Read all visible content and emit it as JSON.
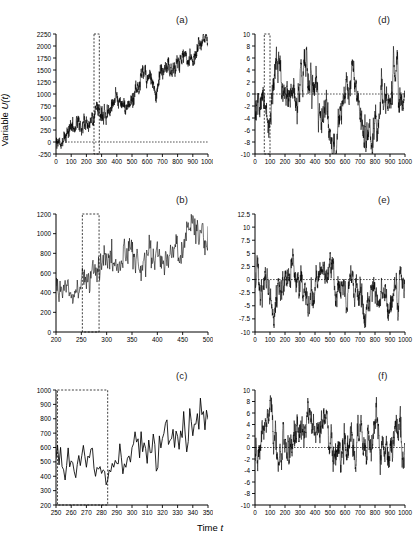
{
  "figure": {
    "axis_title_y_prefix": "Variable ",
    "axis_title_y_var": "U",
    "axis_title_y_arg": "(t)",
    "axis_title_x_prefix": "Time ",
    "axis_title_x_var": "t",
    "line_color": "#000000",
    "dash_color": "#2b2b2b",
    "background": "#ffffff"
  },
  "chart_data": [
    {
      "id": "a",
      "label": "(a)",
      "type": "line",
      "title": "",
      "xlabel": "",
      "ylabel": "",
      "xlim": [
        0,
        1000
      ],
      "ylim": [
        -250,
        2250
      ],
      "xticks": [
        0,
        100,
        200,
        300,
        400,
        500,
        600,
        700,
        800,
        900,
        1000
      ],
      "yticks": [
        -250,
        0,
        250,
        500,
        750,
        1000,
        1250,
        1500,
        1750,
        2000,
        2250
      ],
      "grid": false,
      "legend": null,
      "annotations": {
        "zero_line_y": 0,
        "highlight_box": {
          "x0": 250,
          "x1": 285,
          "y0": -250,
          "y1": 2250
        }
      },
      "series": [
        {
          "name": "U(t)",
          "description": "Random walk with positive linear drift, strongly trending from ~0 to ~2050 with dense high-frequency noise.",
          "model": "trend_noise",
          "n": 1000,
          "x_start": 0,
          "x_step": 1,
          "trend_start": 20,
          "trend_end": 2000,
          "noise_amplitude": 150,
          "noise_detail": 55,
          "seed": 17
        }
      ]
    },
    {
      "id": "b",
      "label": "(b)",
      "type": "line",
      "title": "",
      "xlabel": "",
      "ylabel": "",
      "xlim": [
        200,
        500
      ],
      "ylim": [
        0,
        1200
      ],
      "xticks": [
        200,
        250,
        300,
        350,
        400,
        450,
        500
      ],
      "yticks": [
        0,
        200,
        400,
        600,
        800,
        1000,
        1200
      ],
      "grid": false,
      "legend": null,
      "annotations": {
        "zero_line_y": null,
        "highlight_box": {
          "x0": 252,
          "x1": 285,
          "y0": 0,
          "y1": 1200
        }
      },
      "series": [
        {
          "name": "U(t)",
          "description": "Zoom of panel (a) over t = 200 to 500; mean rises from ~480 to ~980 with noise of about +/-150.",
          "model": "trend_noise",
          "n": 301,
          "x_start": 200,
          "x_step": 1,
          "trend_start": 470,
          "trend_end": 960,
          "noise_amplitude": 150,
          "noise_detail": 60,
          "seed": 17
        }
      ]
    },
    {
      "id": "c",
      "label": "(c)",
      "type": "line",
      "title": "",
      "xlabel": "",
      "ylabel": "",
      "xlim": [
        250,
        350
      ],
      "ylim": [
        200,
        1000
      ],
      "xticks": [
        250,
        260,
        270,
        280,
        290,
        300,
        310,
        320,
        330,
        340,
        350
      ],
      "yticks": [
        200,
        300,
        400,
        500,
        600,
        700,
        800,
        900,
        1000
      ],
      "grid": false,
      "legend": null,
      "annotations": {
        "zero_line_y": null,
        "highlight_box": {
          "x0": 251,
          "x1": 284,
          "y0": 200,
          "y1": 1000
        }
      },
      "series": [
        {
          "name": "U(t)",
          "description": "Zoom of panel (b) over t = 250 to 350; mean rises from ~530 to ~700, single-sample zigzag clearly resolved, final spike to ~1010.",
          "model": "trend_noise",
          "n": 101,
          "x_start": 250,
          "x_step": 1,
          "trend_start": 520,
          "trend_end": 700,
          "noise_amplitude": 130,
          "noise_detail": 70,
          "seed": 17
        }
      ]
    },
    {
      "id": "d",
      "label": "(d)",
      "type": "line",
      "title": "",
      "xlabel": "",
      "ylabel": "",
      "xlim": [
        0,
        1000
      ],
      "ylim": [
        -10,
        10
      ],
      "xticks": [
        0,
        100,
        200,
        300,
        400,
        500,
        600,
        700,
        800,
        900,
        1000
      ],
      "yticks": [
        -10,
        -8,
        -6,
        -4,
        -2,
        0,
        2,
        4,
        6,
        8,
        10
      ],
      "grid": false,
      "legend": null,
      "annotations": {
        "zero_line_y": 0,
        "highlight_box": {
          "x0": 62,
          "x1": 100,
          "y0": -10,
          "y1": 10
        }
      },
      "series": [
        {
          "name": "U(t)",
          "description": "Stationary detrended series oscillating about zero between roughly -8.5 and +9.5 with slow wandering envelope.",
          "model": "stationary_wander",
          "n": 1000,
          "x_start": 0,
          "x_step": 1,
          "mean": 0,
          "slow_amplitude": 4.5,
          "fast_amplitude": 1.6,
          "seed": 41
        }
      ]
    },
    {
      "id": "e",
      "label": "(e)",
      "type": "line",
      "title": "",
      "xlabel": "",
      "ylabel": "",
      "xlim": [
        0,
        1000
      ],
      "ylim": [
        -10,
        12.5
      ],
      "xticks": [
        0,
        100,
        200,
        300,
        400,
        500,
        600,
        700,
        800,
        900,
        1000
      ],
      "yticks": [
        -10,
        -7.5,
        -5,
        -2.5,
        0,
        2.5,
        5,
        7.5,
        10,
        12.5
      ],
      "grid": false,
      "legend": null,
      "annotations": {
        "zero_line_y": 0,
        "highlight_box": null
      },
      "series": [
        {
          "name": "U(t)",
          "description": "Stationary series about zero, peak near t=270 reaching ~10.8, deepest trough near t=60 at about -9.",
          "model": "stationary_wander",
          "n": 1000,
          "x_start": 0,
          "x_step": 1,
          "mean": 0,
          "slow_amplitude": 4.2,
          "fast_amplitude": 1.5,
          "seed": 73
        }
      ]
    },
    {
      "id": "f",
      "label": "(f)",
      "type": "line",
      "title": "",
      "xlabel": "",
      "ylabel": "",
      "xlim": [
        0,
        1000
      ],
      "ylim": [
        -10,
        10
      ],
      "xticks": [
        0,
        100,
        200,
        300,
        400,
        500,
        600,
        700,
        800,
        900,
        1000
      ],
      "yticks": [
        -10,
        -8,
        -6,
        -4,
        -2,
        0,
        2,
        4,
        6,
        8,
        10
      ],
      "grid": false,
      "legend": null,
      "annotations": {
        "zero_line_y": 0,
        "highlight_box": null
      },
      "series": [
        {
          "name": "U(t)",
          "description": "Stationary series about zero; mostly positive excursions up to ~8 before t=400, mostly negative down to ~-8 after t=600.",
          "model": "stationary_wander",
          "n": 1000,
          "x_start": 0,
          "x_step": 1,
          "mean": 0,
          "slow_amplitude": 3.8,
          "fast_amplitude": 1.7,
          "seed": 95
        }
      ]
    }
  ],
  "layout": {
    "panels": [
      {
        "id": "a",
        "left": 8,
        "top": 6,
        "width": 205,
        "height": 175,
        "plot_left": 48,
        "plot_top": 28,
        "plot_width": 152,
        "plot_height": 120,
        "label_x": 168,
        "label_y": 8
      },
      {
        "id": "d",
        "left": 213,
        "top": 6,
        "width": 206,
        "height": 175,
        "plot_left": 42,
        "plot_top": 28,
        "plot_width": 150,
        "plot_height": 120,
        "label_x": 165,
        "label_y": 8
      },
      {
        "id": "b",
        "left": 8,
        "top": 184,
        "width": 205,
        "height": 178,
        "plot_left": 48,
        "plot_top": 30,
        "plot_width": 152,
        "plot_height": 118,
        "label_x": 168,
        "label_y": 10
      },
      {
        "id": "e",
        "left": 213,
        "top": 184,
        "width": 206,
        "height": 178,
        "plot_left": 42,
        "plot_top": 30,
        "plot_width": 150,
        "plot_height": 118,
        "label_x": 165,
        "label_y": 10
      },
      {
        "id": "c",
        "left": 8,
        "top": 364,
        "width": 205,
        "height": 170,
        "plot_left": 48,
        "plot_top": 26,
        "plot_width": 152,
        "plot_height": 115,
        "label_x": 168,
        "label_y": 6
      },
      {
        "id": "f",
        "left": 213,
        "top": 364,
        "width": 206,
        "height": 170,
        "plot_left": 42,
        "plot_top": 26,
        "plot_width": 150,
        "plot_height": 115,
        "label_x": 165,
        "label_y": 6
      }
    ]
  }
}
